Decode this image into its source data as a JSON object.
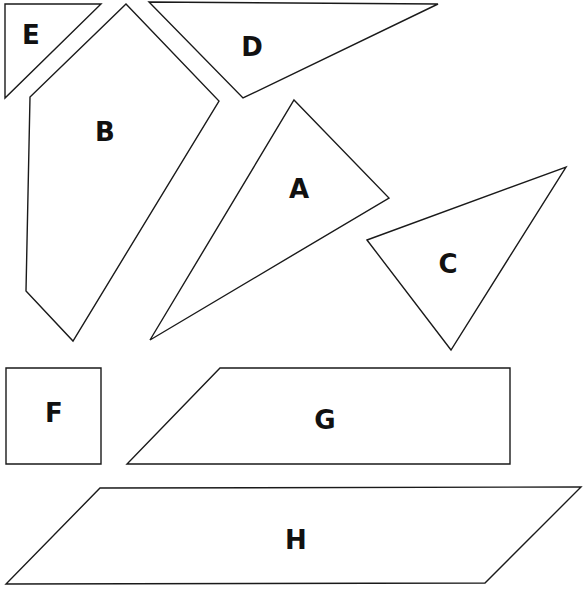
{
  "diagram": {
    "type": "tangram-style polygon pieces",
    "pieces": [
      {
        "label": "A",
        "shape": "triangle",
        "points": "294,100 389,198 150,340",
        "label_pos": [
          299,
          189
        ]
      },
      {
        "label": "B",
        "shape": "pentagon",
        "points": "126,4 219,101 73,341 26,291 30,97",
        "label_pos": [
          105,
          132
        ]
      },
      {
        "label": "C",
        "shape": "triangle",
        "points": "367,240 566,167 451,350",
        "label_pos": [
          448,
          264
        ]
      },
      {
        "label": "D",
        "shape": "triangle",
        "points": "149,2 438,4 243,98",
        "label_pos": [
          252,
          47
        ]
      },
      {
        "label": "E",
        "shape": "triangle",
        "points": "5,4 101,4 5,98",
        "label_pos": [
          31,
          35
        ]
      },
      {
        "label": "F",
        "shape": "square",
        "points": "6,368 101,368 101,464 6,464",
        "label_pos": [
          54,
          413
        ]
      },
      {
        "label": "G",
        "shape": "trapezoid",
        "points": "220,368 510,368 510,464 127,464",
        "label_pos": [
          325,
          420
        ]
      },
      {
        "label": "H",
        "shape": "parallelogram",
        "points": "100,488 581,487 485,583 6,584",
        "label_pos": [
          296,
          540
        ]
      }
    ]
  }
}
